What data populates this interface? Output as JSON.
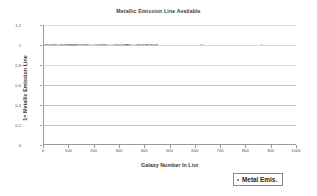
{
  "chart_data": {
    "type": "scatter",
    "title": "Metallic Emission Line Available",
    "xlabel": "Galaxy Number In List",
    "ylabel": "1= Metallic Emission Line",
    "xlim": [
      0,
      1000
    ],
    "ylim": [
      0,
      1.2
    ],
    "grid": true,
    "legend_position": "bottom-right",
    "xticks": [
      0,
      100,
      200,
      300,
      400,
      500,
      600,
      700,
      800,
      900,
      1000
    ],
    "xtick_labels": [
      "0",
      "100",
      "200",
      "300",
      "400",
      "500",
      "600",
      "700",
      "800",
      "900",
      "1000"
    ],
    "yticks": [
      0,
      0.2,
      0.4,
      0.6,
      0.8,
      1,
      1.2
    ],
    "ytick_labels": [
      "0",
      "0.2",
      "0.4",
      "0.6",
      "0.8",
      "1",
      "1.2"
    ],
    "series": [
      {
        "name": "Metal Emis.",
        "marker": "dot",
        "color": "#6b6f78",
        "x": [
          4,
          9,
          14,
          18,
          22,
          27,
          31,
          36,
          41,
          47,
          52,
          58,
          63,
          69,
          74,
          80,
          86,
          92,
          97,
          99,
          101,
          103,
          105,
          107,
          109,
          111,
          113,
          115,
          117,
          119,
          121,
          123,
          125,
          127,
          129,
          131,
          134,
          138,
          142,
          147,
          152,
          158,
          164,
          171,
          178,
          186,
          194,
          201,
          205,
          209,
          213,
          217,
          221,
          226,
          231,
          238,
          246,
          255,
          264,
          272,
          279,
          286,
          292,
          297,
          301,
          305,
          309,
          313,
          317,
          321,
          325,
          329,
          333,
          338,
          344,
          351,
          358,
          366,
          373,
          379,
          384,
          389,
          394,
          399,
          404,
          409,
          414,
          419,
          424,
          429,
          434,
          439,
          444,
          449,
          620,
          628,
          860
        ],
        "y": [
          1,
          1,
          1,
          1,
          1,
          1,
          1,
          1,
          1,
          1,
          1,
          1,
          1,
          1,
          1,
          1,
          1,
          1,
          1,
          1,
          1,
          1,
          1,
          1,
          1,
          1,
          1,
          1,
          1,
          1,
          1,
          1,
          1,
          1,
          1,
          1,
          1,
          1,
          1,
          1,
          1,
          1,
          1,
          1,
          1,
          1,
          1,
          1,
          1,
          1,
          1,
          1,
          1,
          1,
          1,
          1,
          1,
          1,
          1,
          1,
          1,
          1,
          1,
          1,
          1,
          1,
          1,
          1,
          1,
          1,
          1,
          1,
          1,
          1,
          1,
          1,
          1,
          1,
          1,
          1,
          1,
          1,
          1,
          1,
          1,
          1,
          1,
          1,
          1,
          1,
          1,
          1,
          1,
          1,
          1,
          1,
          1
        ]
      }
    ]
  },
  "legend": {
    "entries": [
      {
        "label": "Metal Emis.",
        "marker": "square-marker",
        "color": "#8d9099"
      }
    ]
  }
}
